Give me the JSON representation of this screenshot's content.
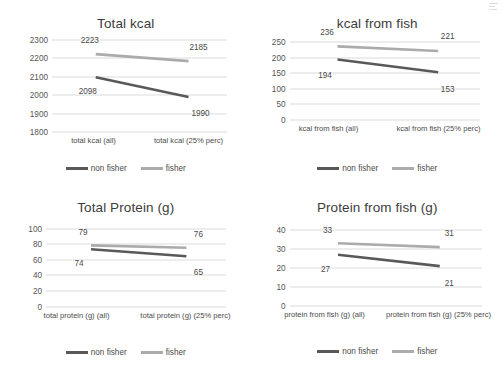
{
  "series_colors": {
    "non_fisher": "#595959",
    "fisher": "#ABABAB",
    "gridline": "#DCDCDC",
    "text": "#4A4A4A"
  },
  "legend": {
    "non_fisher_label": "non fisher",
    "fisher_label": "fisher"
  },
  "chart_data": [
    {
      "type": "line",
      "id": "total-kcal",
      "title": "Total kcal",
      "xlabel": "",
      "ylabel": "",
      "ylim": [
        1800,
        2300
      ],
      "yticks": [
        2300,
        2200,
        2100,
        2000,
        1900,
        1800
      ],
      "grid": true,
      "legend_position": "bottom",
      "categories": [
        "total kcal (all)",
        "total kcal (25% perc)"
      ],
      "series": [
        {
          "name": "non fisher",
          "values": [
            2098,
            1990
          ],
          "color": "#595959"
        },
        {
          "name": "fisher",
          "values": [
            2223,
            2185
          ],
          "color": "#ABABAB"
        }
      ],
      "data_labels": [
        "2223",
        "2185",
        "2098",
        "1990"
      ]
    },
    {
      "type": "line",
      "id": "kcal-from-fish",
      "title": "kcal from fish",
      "xlabel": "",
      "ylabel": "",
      "ylim": [
        0,
        250
      ],
      "yticks": [
        250,
        200,
        150,
        100,
        50,
        0
      ],
      "grid": true,
      "legend_position": "bottom",
      "categories": [
        "kcal from fish (all)",
        "kcal from fish (25% perc)"
      ],
      "series": [
        {
          "name": "non fisher",
          "values": [
            194,
            153
          ],
          "color": "#595959"
        },
        {
          "name": "fisher",
          "values": [
            236,
            221
          ],
          "color": "#ABABAB"
        }
      ],
      "data_labels": [
        "236",
        "221",
        "194",
        "153"
      ]
    },
    {
      "type": "line",
      "id": "total-protein",
      "title": "Total Protein (g)",
      "xlabel": "",
      "ylabel": "",
      "ylim": [
        0,
        100
      ],
      "yticks": [
        100,
        80,
        60,
        40,
        20,
        0
      ],
      "grid": true,
      "legend_position": "bottom",
      "categories": [
        "total protein (g) (all)",
        "total protein (g) (25% perc)"
      ],
      "series": [
        {
          "name": "non fisher",
          "values": [
            74,
            65
          ],
          "color": "#595959"
        },
        {
          "name": "fisher",
          "values": [
            79,
            76
          ],
          "color": "#ABABAB"
        }
      ],
      "data_labels": [
        "79",
        "76",
        "74",
        "65"
      ]
    },
    {
      "type": "line",
      "id": "protein-from-fish",
      "title": "Protein from fish (g)",
      "xlabel": "",
      "ylabel": "",
      "ylim": [
        0,
        40
      ],
      "yticks": [
        40,
        30,
        20,
        10,
        0
      ],
      "grid": true,
      "legend_position": "bottom",
      "categories": [
        "protein from fish (g) (all)",
        "protein from fish (g) (25% perc)"
      ],
      "series": [
        {
          "name": "non fisher",
          "values": [
            27,
            21
          ],
          "color": "#595959"
        },
        {
          "name": "fisher",
          "values": [
            33,
            31
          ],
          "color": "#ABABAB"
        }
      ],
      "data_labels": [
        "33",
        "31",
        "27",
        "21"
      ]
    }
  ]
}
